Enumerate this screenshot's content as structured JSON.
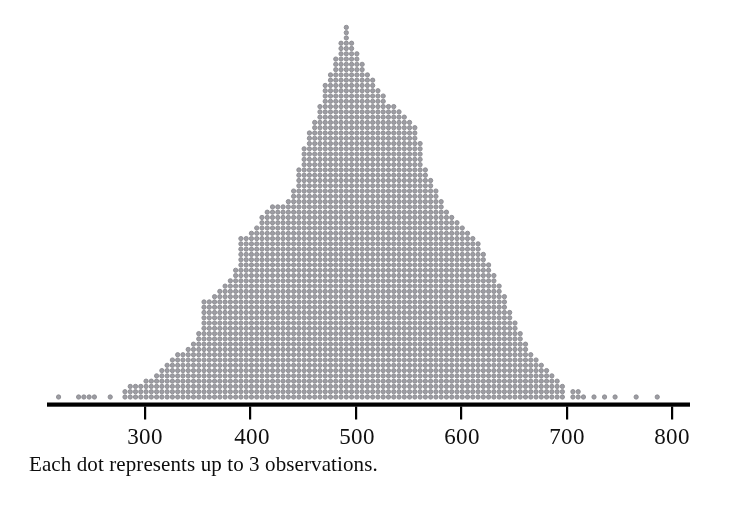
{
  "figure": {
    "caption": "Each dot represents up to 3 observations.",
    "background_color": "#ffffff",
    "dot_color": "#9d9da3",
    "dot_edge_color": "#8a8a90",
    "axis_color": "#000000"
  },
  "axis": {
    "tick_labels": [
      "300",
      "400",
      "500",
      "600",
      "700",
      "800"
    ],
    "tick_values": [
      300,
      400,
      500,
      600,
      700,
      800
    ]
  },
  "chart_data": {
    "type": "bar",
    "plot_style": "dotplot",
    "title": "",
    "xlabel": "",
    "ylabel": "",
    "annotations": [
      "Each dot represents up to 3 observations."
    ],
    "dot_value": 3,
    "grid": false,
    "legend": "none",
    "xlim": [
      205,
      815
    ],
    "xticks": [
      300,
      400,
      500,
      600,
      700,
      800
    ],
    "bin_width": 5,
    "note": "x = bin center (data units); y = number of dots stacked in that bin; each dot = up to 3 observations",
    "x": [
      218,
      237,
      242,
      247,
      252,
      267,
      281,
      286,
      291,
      296,
      301,
      306,
      311,
      316,
      321,
      326,
      331,
      336,
      341,
      346,
      351,
      356,
      361,
      366,
      371,
      376,
      381,
      386,
      391,
      396,
      401,
      406,
      411,
      416,
      421,
      426,
      431,
      436,
      441,
      446,
      451,
      456,
      461,
      466,
      471,
      476,
      481,
      486,
      491,
      496,
      501,
      506,
      511,
      516,
      521,
      526,
      531,
      536,
      541,
      546,
      551,
      556,
      561,
      566,
      571,
      576,
      581,
      586,
      591,
      596,
      601,
      606,
      611,
      616,
      621,
      626,
      631,
      636,
      641,
      646,
      651,
      656,
      661,
      666,
      671,
      676,
      681,
      686,
      691,
      696,
      706,
      711,
      716,
      726,
      736,
      746,
      766,
      786
    ],
    "values": [
      1,
      1,
      1,
      1,
      1,
      1,
      2,
      3,
      3,
      3,
      4,
      4,
      5,
      6,
      7,
      8,
      9,
      9,
      10,
      11,
      13,
      19,
      19,
      20,
      21,
      22,
      23,
      25,
      31,
      31,
      32,
      33,
      35,
      36,
      37,
      37,
      37,
      38,
      40,
      44,
      48,
      51,
      53,
      56,
      60,
      62,
      65,
      68,
      71,
      68,
      66,
      64,
      62,
      61,
      59,
      58,
      56,
      56,
      55,
      54,
      53,
      52,
      49,
      44,
      42,
      40,
      38,
      36,
      35,
      34,
      33,
      32,
      31,
      30,
      28,
      26,
      24,
      22,
      20,
      17,
      15,
      13,
      11,
      9,
      8,
      7,
      6,
      5,
      4,
      3,
      2,
      2,
      1,
      1,
      1,
      1,
      1,
      1
    ]
  }
}
